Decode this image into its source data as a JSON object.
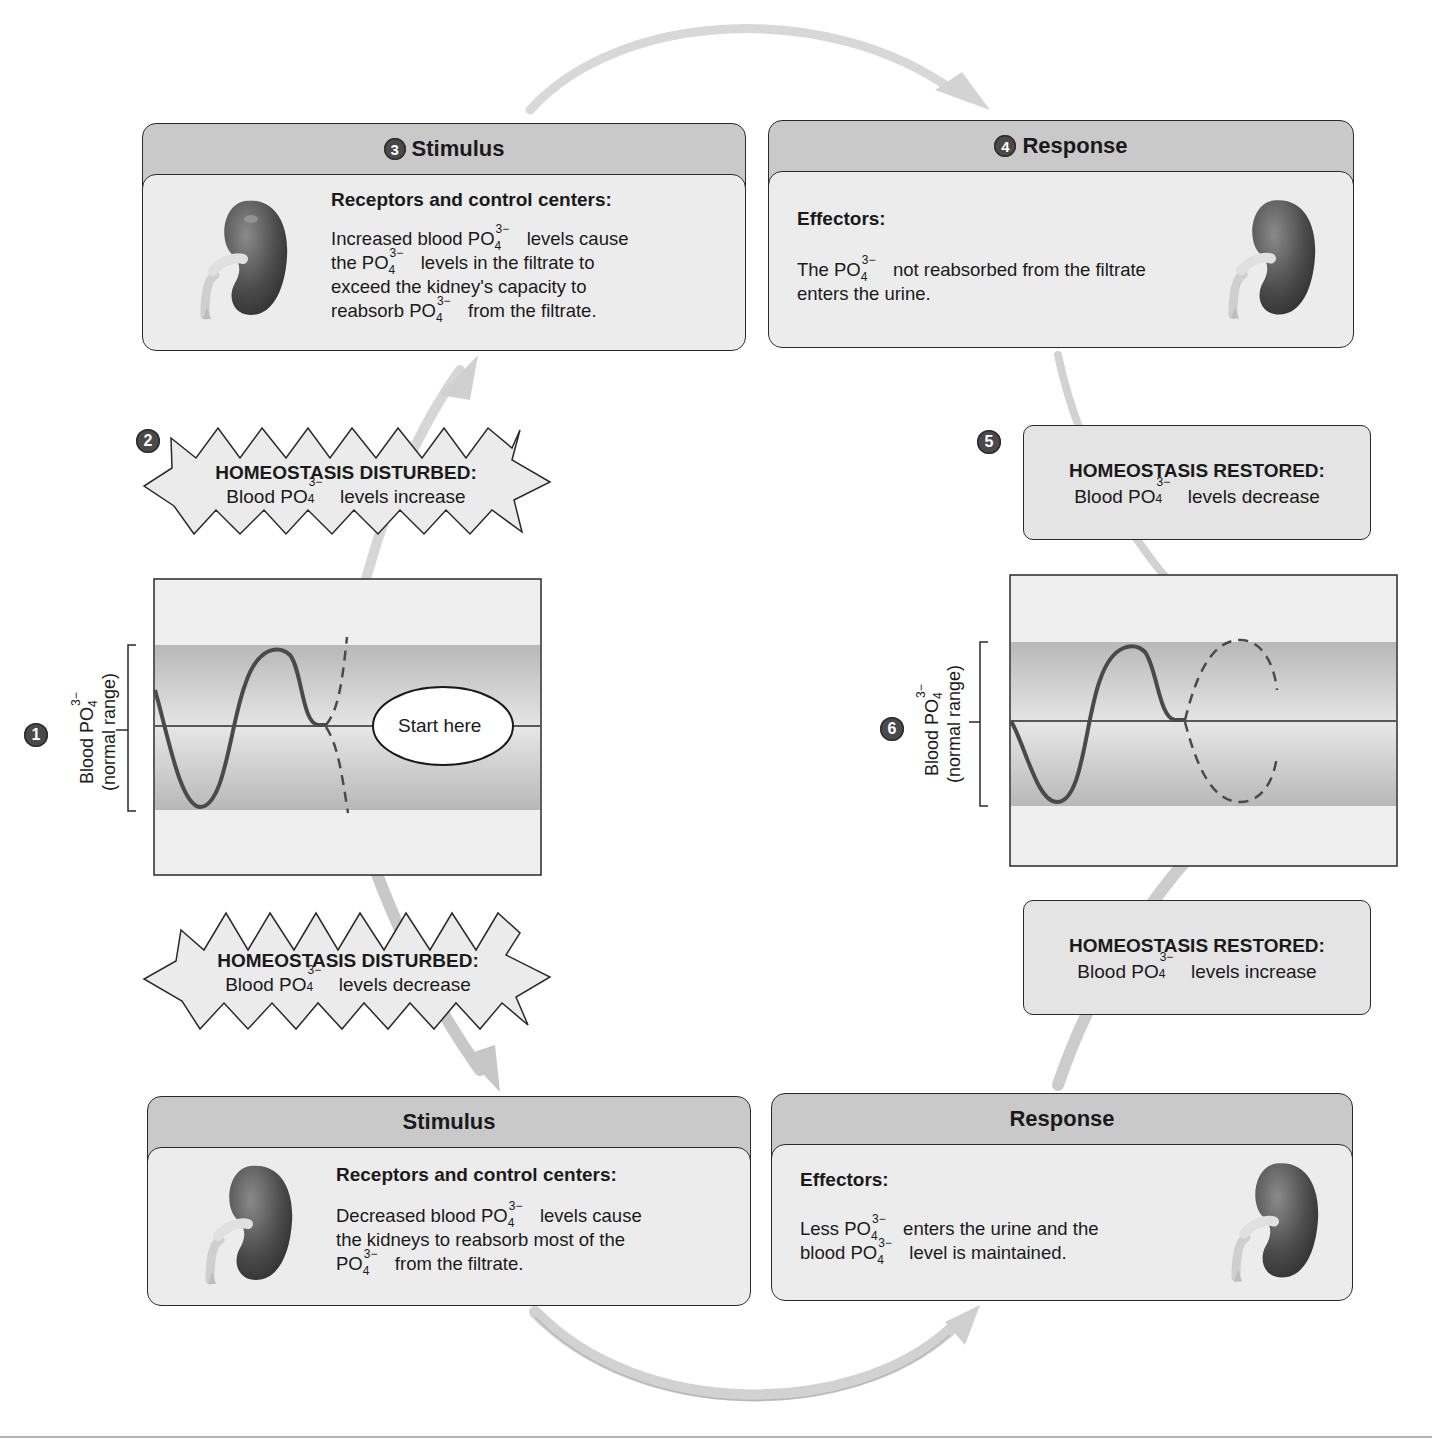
{
  "diagram": {
    "ion": {
      "base": "PO",
      "sub": "4",
      "sup": "3−"
    },
    "steps": {
      "s1": {
        "number": "1",
        "graph": {
          "ylabel_line1": "Blood PO",
          "ylabel_sub": "4",
          "ylabel_sup": "3−",
          "ylabel_line2": "(normal range)",
          "callout": "Start here"
        }
      },
      "s2": {
        "number": "2",
        "title": "HOMEOSTASIS DISTURBED:",
        "pre": "Blood PO",
        "post": " levels increase"
      },
      "s3": {
        "number": "3",
        "header": "Stimulus",
        "subtitle": "Receptors and control centers:",
        "lines": [
          {
            "pre": "Increased blood PO",
            "post": " levels cause"
          },
          {
            "pre": "the PO",
            "post": " levels in the filtrate to"
          },
          {
            "pre": "exceed the kidney's capacity to",
            "post": ""
          },
          {
            "pre": "reabsorb PO",
            "post": " from the filtrate."
          }
        ]
      },
      "s4": {
        "number": "4",
        "header": "Response",
        "subtitle": "Effectors:",
        "lines": [
          {
            "pre": "The PO",
            "post": " not reabsorbed from the filtrate"
          },
          {
            "pre": "enters the urine.",
            "post": ""
          }
        ]
      },
      "s5": {
        "number": "5",
        "title": "HOMEOSTASIS RESTORED:",
        "pre": "Blood PO",
        "post": " levels decrease"
      },
      "s6": {
        "number": "6",
        "graph": {
          "ylabel_line1": "Blood PO",
          "ylabel_sub": "4",
          "ylabel_sup": "3−",
          "ylabel_line2": "(normal range)"
        }
      }
    },
    "lower": {
      "disturbed": {
        "title": "HOMEOSTASIS DISTURBED:",
        "pre": "Blood PO",
        "post": " levels decrease"
      },
      "stimulus": {
        "header": "Stimulus",
        "subtitle": "Receptors and control centers:",
        "lines": [
          {
            "pre": "Decreased blood PO",
            "post": " levels cause"
          },
          {
            "pre": "the kidneys to reabsorb most of the",
            "post": ""
          },
          {
            "pre": "PO",
            "post": "  from the filtrate."
          }
        ]
      },
      "response": {
        "header": "Response",
        "subtitle": "Effectors:",
        "lines": [
          {
            "pre": "Less PO",
            "post": "  enters the urine and the"
          },
          {
            "pre": "blood PO",
            "post": "  level is maintained."
          }
        ]
      },
      "restored": {
        "title": "HOMEOSTASIS RESTORED:",
        "pre": "Blood PO",
        "post": " levels increase"
      }
    },
    "colors": {
      "card_header": "#c9c9c9",
      "card_body": "#ececec",
      "normal_band": "#bdbdbd",
      "graph_bg": "#efefef",
      "curve": "#4a4a4a",
      "badge": "#4a4a4a",
      "arrow": "#d4d4d4"
    }
  }
}
